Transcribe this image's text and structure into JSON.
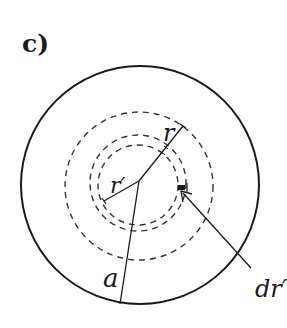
{
  "figure": {
    "panel_label": "c)",
    "labels": {
      "r": "r",
      "r_prime": "r′",
      "a": "a",
      "dr_prime": "dr′"
    },
    "colors": {
      "stroke": "#1a1a1a",
      "background": "#ffffff"
    }
  }
}
